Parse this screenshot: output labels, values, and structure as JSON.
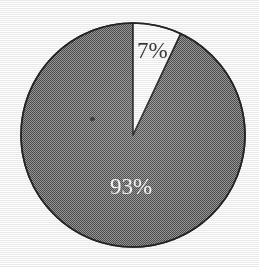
{
  "figure": {
    "kind": "pie-chart",
    "width": 259,
    "height": 267,
    "background_color": "#fefefe",
    "center_x": 133,
    "center_y": 135,
    "radius": 112,
    "outline_color": "#262626",
    "outline_width": 1.6,
    "start_angle_deg": 0,
    "direction": "clockwise",
    "texture": "halftone-checkerboard-dither"
  },
  "chart_data": {
    "type": "pie",
    "title": "",
    "subtitle": "",
    "xlabel": "",
    "ylabel": "",
    "legend": [],
    "legend_position": "none",
    "grid": false,
    "labels_shown_as": "percent",
    "total_percent": 100,
    "categories": [
      "minor",
      "major"
    ],
    "values": [
      7,
      93
    ],
    "slices": [
      {
        "name": "minor-slice",
        "value": 7,
        "label": "7%",
        "fill": "#ffffff",
        "fill_description": "white",
        "start_angle_deg": 0,
        "end_angle_deg": 25.2,
        "label_color": "#3a3a3a",
        "label_x": 137,
        "label_y": 39
      },
      {
        "name": "major-slice",
        "value": 93,
        "label": "93%",
        "fill": "#7a7a7a",
        "fill_description": "gray halftone dither",
        "start_angle_deg": 25.2,
        "end_angle_deg": 360,
        "label_color": "#f4f4f4",
        "label_x": 110,
        "label_y": 175
      }
    ]
  },
  "artifacts": {
    "scan_speck": {
      "name": "scan-speck",
      "x": 90,
      "y": 117
    }
  }
}
